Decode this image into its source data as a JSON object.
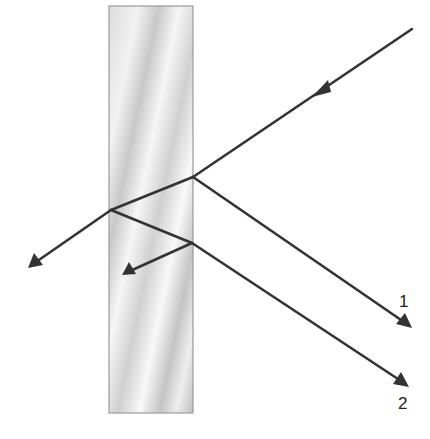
{
  "diagram": {
    "title": "",
    "slab": {
      "x": 109,
      "y": 6,
      "width": 84,
      "height": 407,
      "fill_light": "#f4f4f4",
      "fill_dark": "#bdbdbd",
      "border": "#9a9a9a"
    },
    "colors": {
      "ray": "#333333",
      "background": "#ffffff"
    },
    "rays": [
      {
        "id": "incident",
        "from": [
          412,
          29
        ],
        "to": [
          193,
          177
        ],
        "arrow_at": [
          322,
          90
        ],
        "direction": "in"
      },
      {
        "id": "refracted-1",
        "from": [
          193,
          177
        ],
        "to": [
          111,
          210
        ]
      },
      {
        "id": "reflected-1",
        "from": [
          193,
          177
        ],
        "to": [
          411,
          327
        ],
        "arrow": true
      },
      {
        "id": "transmitted-back",
        "from": [
          111,
          210
        ],
        "to": [
          29,
          267
        ],
        "arrow": true
      },
      {
        "id": "internal-reflected",
        "from": [
          111,
          210
        ],
        "to": [
          192,
          243
        ]
      },
      {
        "id": "internal-reflected-2",
        "from": [
          192,
          243
        ],
        "to": [
          122,
          275
        ],
        "arrow": true
      },
      {
        "id": "reflected-2",
        "from": [
          192,
          243
        ],
        "to": [
          408,
          386
        ],
        "arrow": true
      }
    ],
    "labels": [
      {
        "id": "ray-1-label",
        "text": "1",
        "x": 399,
        "y": 293
      },
      {
        "id": "ray-2-label",
        "text": "2",
        "x": 398,
        "y": 395
      }
    ]
  }
}
